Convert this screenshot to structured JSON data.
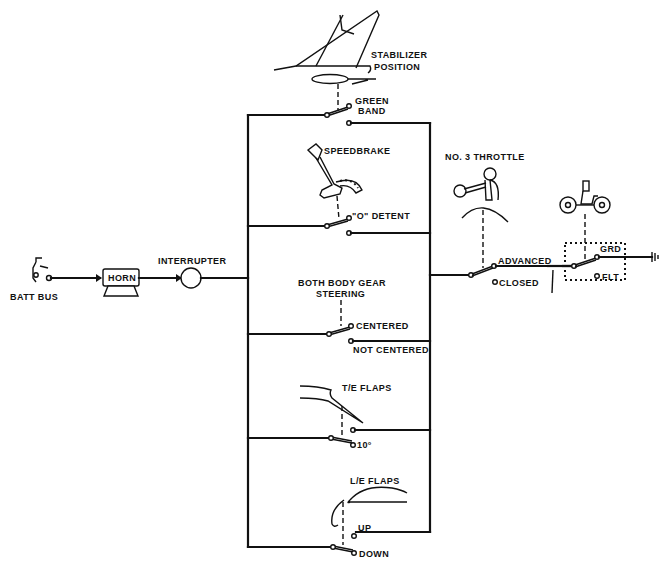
{
  "diagram": {
    "type": "takeoff-warning-circuit-schematic",
    "colors": {
      "ink": "#111111",
      "background": "#ffffff"
    },
    "power": {
      "source_label": "BATT BUS",
      "horn_label": "HORN",
      "interrupter_label": "INTERRUPTER"
    },
    "rungs": [
      {
        "id": "stabilizer",
        "sensor_label_1": "STABILIZER",
        "sensor_label_2": "POSITION",
        "contact_a": "GREEN",
        "contact_b": "BAND"
      },
      {
        "id": "speedbrake",
        "sensor_label": "SPEEDBRAKE",
        "contact_label": "\"O\" DETENT"
      },
      {
        "id": "steering",
        "sensor_label_1": "BOTH BODY GEAR",
        "sensor_label_2": "STEERING",
        "contact_closed": "CENTERED",
        "contact_open": "NOT CENTERED"
      },
      {
        "id": "te-flaps",
        "sensor_label": "T/E FLAPS",
        "contact_label": "10°"
      },
      {
        "id": "le-flaps",
        "sensor_label": "L/E FLAPS",
        "contact_up": "UP",
        "contact_down": "DOWN"
      }
    ],
    "throttle": {
      "label": "NO. 3 THROTTLE",
      "contact_advanced": "ADVANCED",
      "contact_closed": "CLOSED"
    },
    "air_ground": {
      "contact_grd": "GRD",
      "contact_flt": "FLT"
    }
  }
}
